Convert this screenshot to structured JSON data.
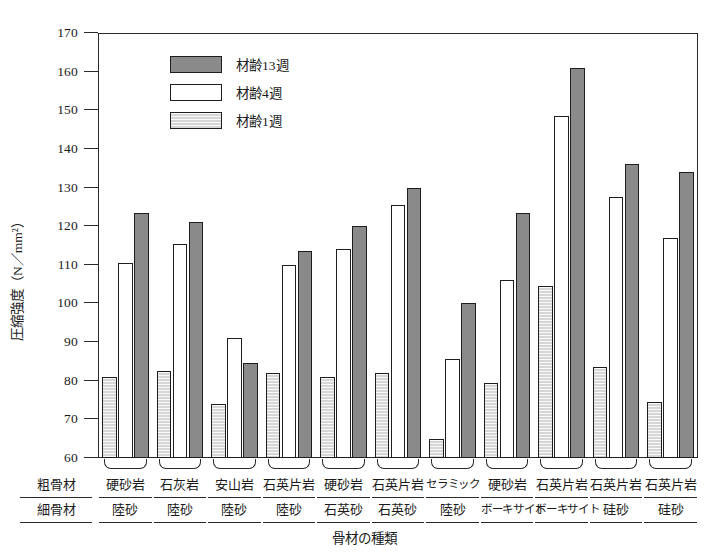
{
  "chart_data": {
    "type": "bar",
    "title": "",
    "xlabel": "骨材の種類",
    "ylabel": "圧縮強度（N／mm²）",
    "ylim": [
      60,
      170
    ],
    "yticks": [
      60,
      70,
      80,
      90,
      100,
      110,
      120,
      130,
      140,
      150,
      160,
      170
    ],
    "grid": false,
    "legend_position": "upper-left-inside",
    "row_headers": [
      "粗骨材",
      "細骨材"
    ],
    "categories": [
      {
        "coarse": "硬砂岩",
        "fine": "陸砂"
      },
      {
        "coarse": "石灰岩",
        "fine": "陸砂"
      },
      {
        "coarse": "安山岩",
        "fine": "陸砂"
      },
      {
        "coarse": "石英片岩",
        "fine": "陸砂"
      },
      {
        "coarse": "硬砂岩",
        "fine": "石英砂"
      },
      {
        "coarse": "石英片岩",
        "fine": "石英砂"
      },
      {
        "coarse": "セラミック",
        "fine": "陸砂"
      },
      {
        "coarse": "硬砂岩",
        "fine": "ボーキサイト"
      },
      {
        "coarse": "石英片岩",
        "fine": "ボーキサイト"
      },
      {
        "coarse": "石英片岩",
        "fine": "硅砂"
      },
      {
        "coarse": "石英片岩",
        "fine": "硅砂"
      }
    ],
    "series": [
      {
        "name": "材齢1週",
        "key": "w1",
        "color": "#d6d6d6",
        "values": [
          81,
          82.5,
          74,
          82,
          81,
          82,
          65,
          79.5,
          104.5,
          83.5,
          74.5
        ]
      },
      {
        "name": "材齢4週",
        "key": "w4",
        "color": "#ffffff",
        "values": [
          110.5,
          115.5,
          91,
          110,
          114,
          125.5,
          85.5,
          106,
          148.5,
          127.5,
          117
        ]
      },
      {
        "name": "材齢13週",
        "key": "w13",
        "color": "#8a8a8a",
        "values": [
          123.5,
          121,
          84.5,
          113.5,
          120,
          130,
          100,
          123.5,
          161,
          136,
          134
        ]
      }
    ],
    "series_draw_order": [
      "w1",
      "w4",
      "w13"
    ]
  }
}
